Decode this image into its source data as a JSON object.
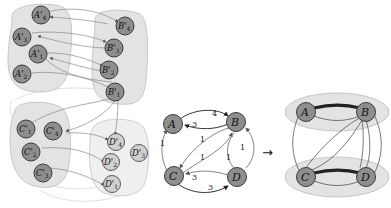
{
  "diagram": {
    "left_panel": {
      "groups": [
        {
          "id": "A",
          "nodes": [
            {
              "label": "A'",
              "sub": "4"
            },
            {
              "label": "A'",
              "sub": "3"
            },
            {
              "label": "A'",
              "sub": "1"
            },
            {
              "label": "A'",
              "sub": "2"
            }
          ]
        },
        {
          "id": "B",
          "nodes": [
            {
              "label": "B'",
              "sub": "4"
            },
            {
              "label": "B'",
              "sub": "3"
            },
            {
              "label": "B'",
              "sub": "2"
            },
            {
              "label": "B'",
              "sub": "1"
            }
          ]
        },
        {
          "id": "C",
          "nodes": [
            {
              "label": "C'",
              "sub": "1"
            },
            {
              "label": "C'",
              "sub": "4"
            },
            {
              "label": "C'",
              "sub": "2"
            },
            {
              "label": "C'",
              "sub": "3"
            }
          ]
        },
        {
          "id": "D",
          "nodes": [
            {
              "label": "D'",
              "sub": "4"
            },
            {
              "label": "D'",
              "sub": "3"
            },
            {
              "label": "D'",
              "sub": "2"
            },
            {
              "label": "D'",
              "sub": "1"
            }
          ]
        }
      ]
    },
    "middle_panel": {
      "nodes": [
        {
          "label": "A"
        },
        {
          "label": "B"
        },
        {
          "label": "C"
        },
        {
          "label": "D"
        }
      ],
      "edge_weights": {
        "A_to_B": "4",
        "B_to_A": "3",
        "C_to_A": "1",
        "B_to_C_outer": "1",
        "C_to_B_inner": "1",
        "D_to_B_left": "1",
        "D_to_B_right": "1",
        "D_to_C": "3",
        "C_to_D": "3"
      }
    },
    "arrow": "→",
    "right_panel": {
      "nodes": [
        {
          "label": "A"
        },
        {
          "label": "B"
        },
        {
          "label": "C"
        },
        {
          "label": "D"
        }
      ]
    }
  }
}
